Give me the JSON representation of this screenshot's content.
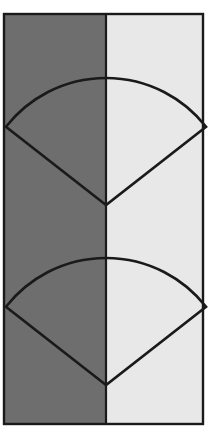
{
  "figure": {
    "type": "geometric-diagram",
    "canvas": {
      "width": 210,
      "height": 444,
      "background": "#ffffff"
    },
    "colors": {
      "dark_panel": "#6E6E6E",
      "light_panel": "#E8E8E8",
      "outline": "#1A1A1A",
      "frame": "#1A1A1A",
      "canvas_background": "#ffffff"
    },
    "frame": {
      "label": "rectangular-frame",
      "x": 4,
      "y": 14,
      "width": 199,
      "height": 410,
      "stroke_width": 2.4
    },
    "panels": [
      {
        "label": "dark-left-panel",
        "fill": "#6E6E6E",
        "x": 4,
        "y": 14,
        "width": 102,
        "height": 410
      },
      {
        "label": "light-right-panel",
        "fill": "#E8E8E8",
        "x": 106,
        "y": 14,
        "width": 97,
        "height": 410
      }
    ],
    "divider": {
      "label": "vertical-divider",
      "x": 106,
      "y1": 14,
      "y2": 424,
      "stroke": "#1A1A1A",
      "stroke_width": 2.2
    },
    "sectors": [
      {
        "label": "upper-sector",
        "apex_x": 106,
        "apex_y": 205,
        "radius": 127,
        "start_angle_deg": -142,
        "end_angle_deg": -38,
        "sweep_deg": 104,
        "left_corner_x": 36,
        "left_corner_y": 122,
        "right_corner_x": 176,
        "right_corner_y": 122,
        "arc_top_x": 106,
        "arc_top_y": 78,
        "fill": "none",
        "stroke": "#1A1A1A",
        "stroke_width": 2.6
      },
      {
        "label": "lower-sector",
        "apex_x": 106,
        "apex_y": 385,
        "radius": 127,
        "start_angle_deg": -142,
        "end_angle_deg": -38,
        "sweep_deg": 104,
        "left_corner_x": 36,
        "left_corner_y": 302,
        "right_corner_x": 176,
        "right_corner_y": 302,
        "arc_top_x": 106,
        "arc_top_y": 258,
        "fill": "none",
        "stroke": "#1A1A1A",
        "stroke_width": 2.6
      }
    ]
  }
}
